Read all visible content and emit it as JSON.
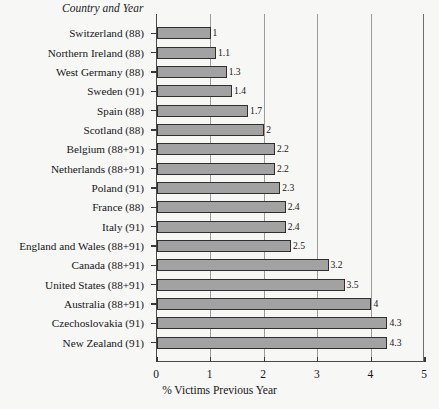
{
  "chart_data": {
    "type": "bar",
    "orientation": "horizontal",
    "title": "",
    "xlabel": "% Victims Previous Year",
    "ylabel": "Country and Year",
    "xlim": [
      0,
      5
    ],
    "xticks": [
      0,
      1,
      2,
      3,
      4,
      5
    ],
    "gridlines": [
      1,
      2,
      3,
      4
    ],
    "grid": true,
    "legend": false,
    "categories": [
      "Switzerland (88)",
      "Northern Ireland (88)",
      "West Germany (88)",
      "Sweden (91)",
      "Spain (88)",
      "Scotland (88)",
      "Belgium (88+91)",
      "Netherlands (88+91)",
      "Poland (91)",
      "France (88)",
      "Italy (91)",
      "England and Wales (88+91)",
      "Canada (88+91)",
      "United States (88+91)",
      "Australia (88+91)",
      "Czechoslovakia (91)",
      "New Zealand (91)"
    ],
    "values": [
      1,
      1.1,
      1.3,
      1.4,
      1.7,
      2,
      2.2,
      2.2,
      2.3,
      2.4,
      2.4,
      2.5,
      3.2,
      3.5,
      4,
      4.3,
      4.3
    ],
    "value_labels": [
      "1",
      "1.1",
      "1.3",
      "1.4",
      "1.7",
      "2",
      "2.2",
      "2.2",
      "2.3",
      "2.4",
      "2.4",
      "2.5",
      "3.2",
      "3.5",
      "4",
      "4.3",
      "4.3"
    ],
    "bar_color": "#a2a2a2",
    "bar_border_color": "#2f2f2f",
    "axis_color": "#3a3a3a",
    "grid_color": "#9b9b9b",
    "background_color": "#f7f7f6"
  }
}
